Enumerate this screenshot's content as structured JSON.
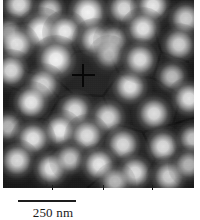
{
  "figure": {
    "kind": "scanning-probe-micrograph",
    "colors": {
      "background": "#ffffff",
      "substrate_dark": "#1a1a1a",
      "particle_bright": "#f2f2f2",
      "ink": "#1a1a1a"
    }
  },
  "micrograph": {
    "frame": {
      "x": 3,
      "y": 0,
      "width": 191,
      "height": 188
    },
    "cursor": {
      "label": "crosshair-cursor",
      "x": 83,
      "y": 75,
      "size": 23
    },
    "particles": [
      {
        "x": 16,
        "y": 6,
        "r": 9,
        "i": 0.92
      },
      {
        "x": 47,
        "y": 11,
        "r": 8,
        "i": 0.78
      },
      {
        "x": 85,
        "y": 14,
        "r": 10,
        "i": 1.0
      },
      {
        "x": 121,
        "y": 10,
        "r": 9,
        "i": 0.88
      },
      {
        "x": 150,
        "y": 7,
        "r": 9,
        "i": 0.95
      },
      {
        "x": 183,
        "y": 20,
        "r": 9,
        "i": 0.86
      },
      {
        "x": 6,
        "y": 34,
        "r": 8,
        "i": 0.7
      },
      {
        "x": 38,
        "y": 33,
        "r": 10,
        "i": 1.0
      },
      {
        "x": 62,
        "y": 33,
        "r": 9,
        "i": 0.96
      },
      {
        "x": 92,
        "y": 41,
        "r": 9,
        "i": 0.9
      },
      {
        "x": 111,
        "y": 41,
        "r": 8,
        "i": 0.72
      },
      {
        "x": 140,
        "y": 30,
        "r": 9,
        "i": 0.93
      },
      {
        "x": 176,
        "y": 46,
        "r": 9,
        "i": 0.84
      },
      {
        "x": 14,
        "y": 46,
        "r": 9,
        "i": 0.9
      },
      {
        "x": 53,
        "y": 61,
        "r": 10,
        "i": 1.0
      },
      {
        "x": 8,
        "y": 72,
        "r": 9,
        "i": 0.88
      },
      {
        "x": 40,
        "y": 86,
        "r": 9,
        "i": 0.85
      },
      {
        "x": 106,
        "y": 56,
        "r": 8,
        "i": 0.66
      },
      {
        "x": 127,
        "y": 88,
        "r": 9,
        "i": 0.92
      },
      {
        "x": 137,
        "y": 61,
        "r": 9,
        "i": 0.9
      },
      {
        "x": 169,
        "y": 78,
        "r": 8,
        "i": 0.74
      },
      {
        "x": 28,
        "y": 104,
        "r": 9,
        "i": 0.94
      },
      {
        "x": 72,
        "y": 112,
        "r": 9,
        "i": 0.88
      },
      {
        "x": 5,
        "y": 128,
        "r": 8,
        "i": 0.72
      },
      {
        "x": 105,
        "y": 119,
        "r": 9,
        "i": 0.86
      },
      {
        "x": 151,
        "y": 115,
        "r": 9,
        "i": 0.9
      },
      {
        "x": 186,
        "y": 100,
        "r": 9,
        "i": 0.92
      },
      {
        "x": 57,
        "y": 132,
        "r": 9,
        "i": 0.96
      },
      {
        "x": 30,
        "y": 140,
        "r": 9,
        "i": 0.93
      },
      {
        "x": 84,
        "y": 137,
        "r": 9,
        "i": 0.9
      },
      {
        "x": 120,
        "y": 146,
        "r": 9,
        "i": 0.88
      },
      {
        "x": 160,
        "y": 148,
        "r": 9,
        "i": 0.9
      },
      {
        "x": 190,
        "y": 140,
        "r": 8,
        "i": 0.8
      },
      {
        "x": 14,
        "y": 162,
        "r": 9,
        "i": 0.9
      },
      {
        "x": 48,
        "y": 170,
        "r": 9,
        "i": 0.92
      },
      {
        "x": 67,
        "y": 160,
        "r": 8,
        "i": 0.78
      },
      {
        "x": 96,
        "y": 166,
        "r": 9,
        "i": 0.94
      },
      {
        "x": 132,
        "y": 174,
        "r": 9,
        "i": 0.9
      },
      {
        "x": 166,
        "y": 178,
        "r": 9,
        "i": 0.88
      },
      {
        "x": 186,
        "y": 166,
        "r": 8,
        "i": 0.76
      },
      {
        "x": 112,
        "y": 183,
        "r": 8,
        "i": 0.72
      }
    ]
  },
  "axis": {
    "ticks": [
      {
        "x": 52
      },
      {
        "x": 103
      },
      {
        "x": 152
      }
    ]
  },
  "scale": {
    "label": "250 nm",
    "bar_length_px": 58
  }
}
